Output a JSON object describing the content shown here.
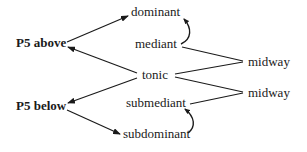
{
  "diagram": {
    "type": "tree/relationship diagram",
    "nodes": {
      "p5_above": "P5 above",
      "p5_below": "P5 below",
      "dominant": "dominant",
      "mediant": "mediant",
      "tonic": "tonic",
      "submediant": "submediant",
      "subdominant": "subdominant",
      "midway_top": "midway",
      "midway_bottom": "midway"
    },
    "edges": [
      {
        "from": "p5_above",
        "to": "dominant",
        "style": "arrow"
      },
      {
        "from": "tonic",
        "to": "p5_above",
        "style": "arrow"
      },
      {
        "from": "tonic",
        "to": "p5_below",
        "style": "arrow"
      },
      {
        "from": "p5_below",
        "to": "subdominant",
        "style": "arrow"
      },
      {
        "from": "mediant",
        "to": "midway_top",
        "style": "line"
      },
      {
        "from": "tonic",
        "to": "midway_top",
        "style": "line"
      },
      {
        "from": "tonic",
        "to": "midway_bottom",
        "style": "line"
      },
      {
        "from": "submediant",
        "to": "midway_bottom",
        "style": "line"
      },
      {
        "from": "mediant",
        "to": "dominant",
        "style": "curved-arrow"
      },
      {
        "from": "subdominant",
        "to": "submediant",
        "style": "curved-arrow"
      }
    ],
    "colors": {
      "stroke": "#1a1a1a",
      "background": "#ffffff"
    }
  }
}
